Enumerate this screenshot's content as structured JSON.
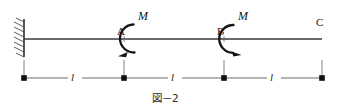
{
  "figure": {
    "caption": "図－2",
    "background_color": "#ffffff",
    "line_color": "#3a3a3a",
    "load_color": "#111111",
    "beam": {
      "name_label": "beam",
      "start_x": 24,
      "end_x": 322,
      "y": 39
    },
    "support": {
      "type": "fixed",
      "x": 24,
      "label": ""
    },
    "nodes": [
      {
        "label": "A",
        "x": 124
      },
      {
        "label": "B",
        "x": 224
      },
      {
        "label": "C",
        "x": 322
      }
    ],
    "moments": [
      {
        "at": "A",
        "label": "M",
        "x": 124,
        "direction": "counterclockwise"
      },
      {
        "at": "B",
        "label": "M",
        "x": 224,
        "direction": "clockwise"
      }
    ],
    "dimensions": {
      "line_y": 78,
      "tick_top_y": 60,
      "marker_positions": [
        24,
        124,
        224,
        322
      ],
      "spans": [
        {
          "label": "l",
          "from": 24,
          "to": 124
        },
        {
          "label": "l",
          "from": 124,
          "to": 224
        },
        {
          "label": "l",
          "from": 224,
          "to": 322
        }
      ]
    }
  }
}
